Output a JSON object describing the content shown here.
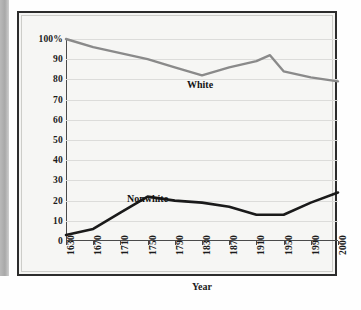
{
  "figure": {
    "axis_title_x": "Year",
    "series_label_white": "White",
    "series_label_nonwhite": "Nonwhite"
  },
  "colors": {
    "white_line": "#8a8a8a",
    "nonwhite_line": "#1a1a1a",
    "gridline": "#dcdcda",
    "axis": "#4a4a4a",
    "frame": "#2c2c2c",
    "plot_background": "#f6f6f4",
    "margin_strip": "#b0b0b0"
  },
  "chart_data": {
    "type": "line",
    "title": "",
    "xlabel": "Year",
    "ylabel": "",
    "x": [
      1630,
      1670,
      1710,
      1750,
      1790,
      1830,
      1870,
      1910,
      1930,
      1950,
      1990,
      2000
    ],
    "tick_labels_x": [
      "1630",
      "1670",
      "1710",
      "1750",
      "1790",
      "1830",
      "1870",
      "1910",
      "1950",
      "1990",
      "2000"
    ],
    "tick_labels_y": [
      "0",
      "10",
      "20",
      "30",
      "40",
      "50",
      "60",
      "70",
      "80",
      "90",
      "100%"
    ],
    "ylim": [
      0,
      100
    ],
    "yticks": [
      0,
      10,
      20,
      30,
      40,
      50,
      60,
      70,
      80,
      90,
      100
    ],
    "grid": true,
    "legend_position": "inline-labels",
    "series": [
      {
        "name": "White",
        "color": "#8a8a8a",
        "values": [
          100,
          96,
          93,
          90,
          86,
          82,
          86,
          89,
          92,
          84,
          81,
          79
        ]
      },
      {
        "name": "Nonwhite",
        "color": "#1a1a1a",
        "values": [
          3,
          6,
          14,
          22,
          20,
          19,
          17,
          13,
          13,
          13,
          19,
          24
        ]
      }
    ]
  }
}
